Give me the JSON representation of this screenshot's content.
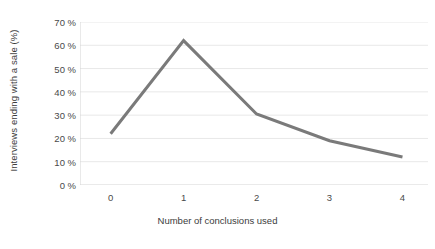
{
  "chart_data": {
    "type": "line",
    "title": "",
    "subtitle": "",
    "xlabel": "Number of conclusions used",
    "ylabel": "Interviews ending with a sale (%)",
    "x": [
      0,
      1,
      2,
      3,
      4
    ],
    "values": [
      22,
      62,
      30.5,
      19,
      12
    ],
    "series": [
      {
        "name": "Interviews ending with a sale",
        "values": [
          22,
          62,
          30.5,
          19,
          12
        ]
      }
    ],
    "x_tick_labels": [
      "0",
      "1",
      "2",
      "3",
      "4"
    ],
    "y_tick_labels": [
      "0 %",
      "10 %",
      "20 %",
      "30 %",
      "40 %",
      "50 %",
      "60 %",
      "70 %"
    ],
    "y_tick_values": [
      0,
      10,
      20,
      30,
      40,
      50,
      60,
      70
    ],
    "xlim": [
      -0.42,
      4.35
    ],
    "ylim": [
      0,
      70
    ],
    "grid": "horizontal",
    "legend": "none",
    "line_color": "#7a7a7a",
    "grid_color": "#e8e8e8",
    "axis_color": "#d4d4d4",
    "text_color": "#3f3f3f",
    "background": "#ffffff",
    "annotations": []
  }
}
